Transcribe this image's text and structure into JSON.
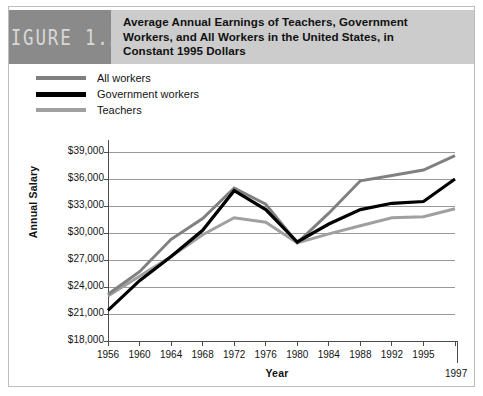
{
  "figure": {
    "badge_label": "FIGURE 1.3",
    "title_lines": [
      "Average Annual Earnings of Teachers, Government",
      "Workers, and All Workers in the United States, in",
      "Constant 1995 Dollars"
    ]
  },
  "colors": {
    "all_workers": "#808080",
    "government_workers": "#000000",
    "teachers": "#a0a0a0",
    "badge_background": "#8a8a8a",
    "title_background": "#cccccc",
    "gridline": "#999999",
    "axis": "#4d4d4d",
    "page_background": "#ffffff"
  },
  "legend": {
    "position": "top-left",
    "items": [
      {
        "label": "All workers",
        "color": "#808080"
      },
      {
        "label": "Government workers",
        "color": "#000000"
      },
      {
        "label": "Teachers",
        "color": "#a0a0a0"
      }
    ]
  },
  "chart_data": {
    "type": "line",
    "title": "Average Annual Earnings of Teachers, Government Workers, and All Workers in the United States, in Constant 1995 Dollars",
    "xlabel": "Year",
    "ylabel": "Annual Salary",
    "x": [
      1956,
      1960,
      1964,
      1968,
      1972,
      1976,
      1980,
      1984,
      1988,
      1992,
      1995,
      1997
    ],
    "xtick_labels": [
      "1956",
      "1960",
      "1964",
      "1968",
      "1972",
      "1976",
      "1980",
      "1984",
      "1988",
      "1992",
      "1995",
      "1997"
    ],
    "ytick_labels": [
      "$18,000",
      "$21,000",
      "$24,000",
      "$27,000",
      "$30,000",
      "$33,000",
      "$36,000",
      "$39,000"
    ],
    "ytick_values": [
      18000,
      21000,
      24000,
      27000,
      30000,
      33000,
      36000,
      39000
    ],
    "ylim": [
      18000,
      39000
    ],
    "grid": true,
    "legend_position": "above-plot-left",
    "series": [
      {
        "name": "All workers",
        "color": "#808080",
        "values": [
          23200,
          25700,
          29300,
          31600,
          35000,
          33200,
          28900,
          32200,
          35800,
          36400,
          37000,
          38600
        ]
      },
      {
        "name": "Government workers",
        "color": "#000000",
        "values": [
          21400,
          24700,
          27400,
          30300,
          34700,
          32600,
          29000,
          31000,
          32600,
          33300,
          33500,
          36000
        ]
      },
      {
        "name": "Teachers",
        "color": "#a0a0a0",
        "values": [
          23000,
          25200,
          27400,
          29800,
          31700,
          31200,
          28900,
          29900,
          30800,
          31700,
          31800,
          32700
        ]
      }
    ]
  }
}
